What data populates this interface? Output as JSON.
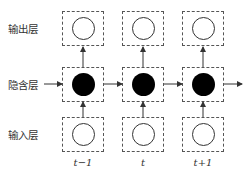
{
  "diagram": {
    "layers": [
      {
        "id": "output",
        "label": "输出层",
        "node_style": "open"
      },
      {
        "id": "hidden",
        "label": "隐含层",
        "node_style": "filled"
      },
      {
        "id": "input",
        "label": "输入层",
        "node_style": "open"
      }
    ],
    "time_steps": [
      {
        "label": "t−1"
      },
      {
        "label": "t"
      },
      {
        "label": "t+1"
      }
    ],
    "edges": [
      {
        "from": "input",
        "to": "hidden",
        "direction": "up",
        "per_time_step": true
      },
      {
        "from": "hidden",
        "to": "output",
        "direction": "up",
        "per_time_step": true
      },
      {
        "from": "hidden(t-1)",
        "to": "hidden(t)",
        "direction": "right"
      },
      {
        "from": "hidden(t)",
        "to": "hidden(t+1)",
        "direction": "right"
      },
      {
        "from": "hidden(t+1)",
        "to": "next",
        "direction": "right"
      },
      {
        "from": "hidden label",
        "to": "hidden(t-1)",
        "direction": "right"
      }
    ],
    "colors": {
      "box_border": "#555555",
      "node_filled": "#000000",
      "node_open_border": "#333333",
      "arrow": "#333333"
    }
  }
}
